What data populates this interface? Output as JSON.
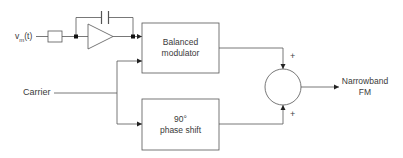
{
  "diagram": {
    "input_label": "v_m(t)",
    "input_label_main": "v",
    "input_label_sub": "m",
    "input_label_tail": "(t)",
    "carrier_label": "Carrier",
    "blocks": {
      "modulator": {
        "line1": "Balanced",
        "line2": "modulator"
      },
      "phase_shift": {
        "line1": "90°",
        "line2": "phase shift"
      }
    },
    "summer_signs": {
      "top": "+",
      "bottom": "+"
    },
    "output_label": {
      "line1": "Narrowband",
      "line2": "FM"
    },
    "line_color": "#555555"
  }
}
